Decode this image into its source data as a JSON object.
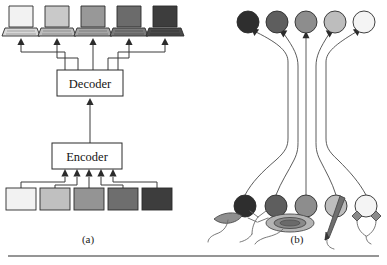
{
  "figure": {
    "title": "",
    "panels": [
      {
        "id": "panel-a",
        "label": "(a)",
        "label_x": 88,
        "label_y": 243,
        "description": "Encoder-decoder pipeline with five grayscale source squares and five grayscale laptop outputs",
        "boxes": [
          {
            "name": "decoder",
            "label": "Decoder",
            "x": 57,
            "y": 70,
            "w": 66,
            "h": 26
          },
          {
            "name": "encoder",
            "label": "Encoder",
            "x": 52,
            "y": 143,
            "w": 70,
            "h": 26
          }
        ],
        "laptops": [
          {
            "index": 0,
            "shade": "#f2f2f2",
            "cx": 21
          },
          {
            "index": 1,
            "shade": "#c9c9c9",
            "cx": 57
          },
          {
            "index": 2,
            "shade": "#989898",
            "cx": 93
          },
          {
            "index": 3,
            "shade": "#6b6b6b",
            "cx": 129
          },
          {
            "index": 4,
            "shade": "#3d3d3d",
            "cx": 165
          }
        ],
        "squares": [
          {
            "index": 0,
            "shade": "#f2f2f2",
            "cx": 21
          },
          {
            "index": 1,
            "shade": "#c0c0c0",
            "cx": 55
          },
          {
            "index": 2,
            "shade": "#949494",
            "cx": 89
          },
          {
            "index": 3,
            "shade": "#6e6e6e",
            "cx": 123
          },
          {
            "index": 4,
            "shade": "#3d3d3d",
            "cx": 157
          }
        ]
      },
      {
        "id": "panel-b",
        "label": "(b)",
        "label_x": 297,
        "label_y": 243,
        "description": "Five grayscale discs at bottom attached to physical objects, connected by long bundled curves to five grayscale discs at top",
        "top_circles": [
          {
            "index": 0,
            "shade": "#2e2e2e",
            "cx": 248,
            "cy": 22,
            "r": 11
          },
          {
            "index": 1,
            "shade": "#5e5e5e",
            "cx": 277,
            "cy": 22,
            "r": 11
          },
          {
            "index": 2,
            "shade": "#8d8d8d",
            "cx": 306,
            "cy": 22,
            "r": 11
          },
          {
            "index": 3,
            "shade": "#bdbdbd",
            "cx": 335,
            "cy": 22,
            "r": 11
          },
          {
            "index": 4,
            "shade": "#f4f4f4",
            "cx": 364,
            "cy": 22,
            "r": 11
          }
        ],
        "bottom_circles": [
          {
            "index": 0,
            "shade": "#2e2e2e",
            "cx": 245,
            "cy": 206,
            "r": 11
          },
          {
            "index": 1,
            "shade": "#5e5e5e",
            "cx": 276,
            "cy": 206,
            "r": 11
          },
          {
            "index": 2,
            "shade": "#8d8d8d",
            "cx": 306,
            "cy": 206,
            "r": 11
          },
          {
            "index": 3,
            "shade": "#bdbdbd",
            "cx": 336,
            "cy": 206,
            "r": 11
          },
          {
            "index": 4,
            "shade": "#f4f4f4",
            "cx": 366,
            "cy": 206,
            "r": 11
          }
        ],
        "objects": [
          {
            "index": 0,
            "name": "leaf",
            "shade": "#8f8f8f"
          },
          {
            "index": 1,
            "name": "twig-branch",
            "shade": "#7d7d7d"
          },
          {
            "index": 2,
            "name": "stone-disc",
            "shade": "#9a9a9a"
          },
          {
            "index": 3,
            "name": "pen",
            "shade": "#5a5a5a"
          },
          {
            "index": 4,
            "name": "diamond-pair",
            "shade": "#8a8a8a"
          }
        ]
      }
    ],
    "rule": {
      "name": "bottom-rule",
      "x1": 8,
      "x2": 379,
      "y": 256
    }
  }
}
